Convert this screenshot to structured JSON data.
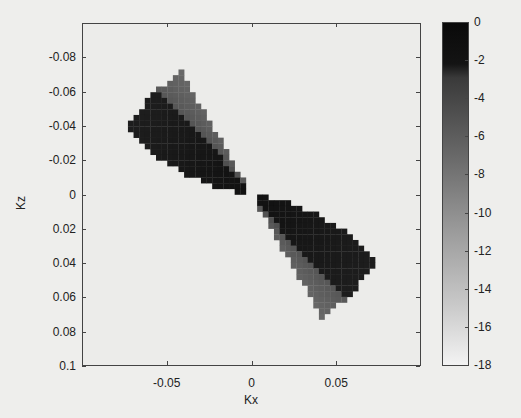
{
  "chart_data": {
    "type": "heatmap",
    "title": "",
    "xlabel": "Kx",
    "ylabel": "Kz",
    "xlim": [
      -0.1,
      0.1
    ],
    "ylim": [
      -0.1,
      0.1
    ],
    "y_inverted": true,
    "x_ticks": [
      -0.05,
      0,
      0.05
    ],
    "x_tick_labels": [
      "-0.05",
      "0",
      "0.05"
    ],
    "y_ticks": [
      -0.08,
      -0.06,
      -0.04,
      -0.02,
      0,
      0.02,
      0.04,
      0.06,
      0.08,
      0.1
    ],
    "y_tick_labels": [
      "-0.08",
      "-0.06",
      "-0.04",
      "-0.02",
      "0",
      "0.02",
      "0.04",
      "0.06",
      "0.08",
      "0.1"
    ],
    "colormap": "gray",
    "colorbar": {
      "range": [
        -18,
        0
      ],
      "ticks": [
        0,
        -2,
        -4,
        -6,
        -8,
        -10,
        -12,
        -14,
        -16,
        -18
      ],
      "tick_labels": [
        "0",
        "-2",
        "-4",
        "-6",
        "-8",
        "-10",
        "-12",
        "-14",
        "-16",
        "-18"
      ]
    },
    "grid": false
  }
}
